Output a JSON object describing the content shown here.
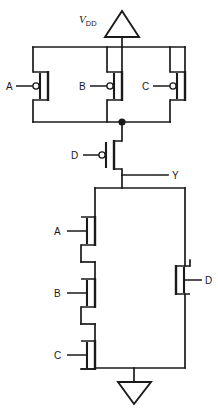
{
  "diagram": {
    "type": "transistor-level-schematic",
    "stroke_color": "#1a1a1a",
    "background_color": "#ffffff"
  },
  "supply": {
    "label_main": "V",
    "label_sub": "DD",
    "symbol": "triangle-up"
  },
  "ground": {
    "symbol": "triangle-down"
  },
  "output": {
    "label": "Y"
  },
  "pull_up": {
    "description": "Parallel PMOS network A, B, C in series with PMOS D",
    "transistors": [
      {
        "id": "pmos-a",
        "label": "A",
        "type": "pmos",
        "orientation": "gate-left"
      },
      {
        "id": "pmos-b",
        "label": "B",
        "type": "pmos",
        "orientation": "gate-left"
      },
      {
        "id": "pmos-c",
        "label": "C",
        "type": "pmos",
        "orientation": "gate-left"
      },
      {
        "id": "pmos-d",
        "label": "D",
        "type": "pmos",
        "orientation": "gate-left"
      }
    ]
  },
  "pull_down": {
    "description": "Series NMOS A, B, C in parallel with NMOS D",
    "transistors": [
      {
        "id": "nmos-a",
        "label": "A",
        "type": "nmos",
        "orientation": "gate-left"
      },
      {
        "id": "nmos-b",
        "label": "B",
        "type": "nmos",
        "orientation": "gate-left"
      },
      {
        "id": "nmos-c",
        "label": "C",
        "type": "nmos",
        "orientation": "gate-left"
      },
      {
        "id": "nmos-d",
        "label": "D",
        "type": "nmos",
        "orientation": "gate-right"
      }
    ]
  },
  "nodes": [
    {
      "id": "pmos-parallel-junction",
      "type": "connection-dot"
    }
  ]
}
